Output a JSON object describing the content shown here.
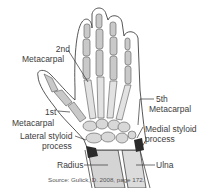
{
  "diagram": {
    "colors": {
      "outline": "#444444",
      "bone_fill": "#c9c9c9",
      "bone_light": "#e2e2e2",
      "forearm_fill": "#d4d4d4",
      "highlight": "#2b2b2b",
      "background": "#ffffff"
    },
    "labels": {
      "second_metacarpal_line1": "2nd",
      "second_metacarpal_line2": "Metacarpal",
      "fifth_metacarpal_line1": "5th",
      "fifth_metacarpal_line2": "Metacarpal",
      "first_metacarpal_line1": "1st",
      "first_metacarpal_line2": "Metacarpal",
      "lateral_styloid_line1": "Lateral styloid",
      "lateral_styloid_line2": "process",
      "medial_styloid_line1": "Medial styloid",
      "medial_styloid_line2": "process",
      "radius": "Radius",
      "ulna": "Ulna"
    },
    "source": "Source: Gulick, D. 2008, page 172."
  }
}
